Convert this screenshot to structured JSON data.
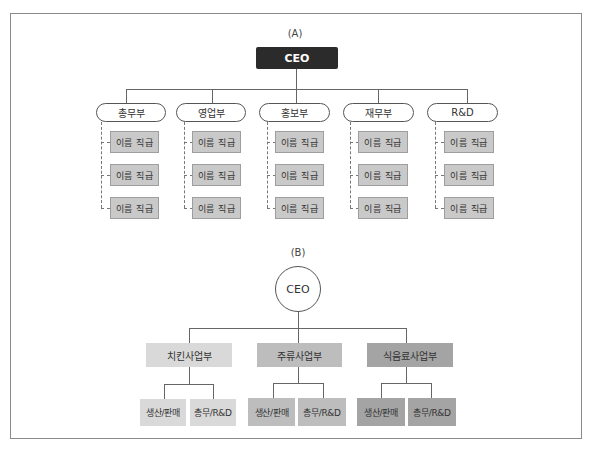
{
  "diagram_a": {
    "label": "(A)",
    "ceo": "CEO",
    "departments": [
      {
        "name": "총무부",
        "employees": [
          "이름 직급",
          "이름 직급",
          "이름 직급"
        ]
      },
      {
        "name": "영업부",
        "employees": [
          "이름 직급",
          "이름 직급",
          "이름 직급"
        ]
      },
      {
        "name": "홍보부",
        "employees": [
          "이름 직급",
          "이름 직급",
          "이름 직급"
        ]
      },
      {
        "name": "재무부",
        "employees": [
          "이름 직급",
          "이름 직급",
          "이름 직급"
        ]
      },
      {
        "name": "R&D",
        "employees": [
          "이름 직급",
          "이름 직급",
          "이름 직급"
        ]
      }
    ],
    "colors": {
      "ceo_bg": "#2b2b2b",
      "employee_bg": "#c9c9c9"
    }
  },
  "diagram_b": {
    "label": "(B)",
    "ceo": "CEO",
    "divisions": [
      {
        "name": "치킨사업부",
        "color": "#d9d9d9",
        "units": [
          "생산/판매",
          "총무/R&D"
        ]
      },
      {
        "name": "주류사업부",
        "color": "#bdbdbd",
        "units": [
          "생산/판매",
          "총무/R&D"
        ]
      },
      {
        "name": "식음료사업부",
        "color": "#a4a4a4",
        "units": [
          "생산/판매",
          "총무/R&D"
        ]
      }
    ]
  }
}
